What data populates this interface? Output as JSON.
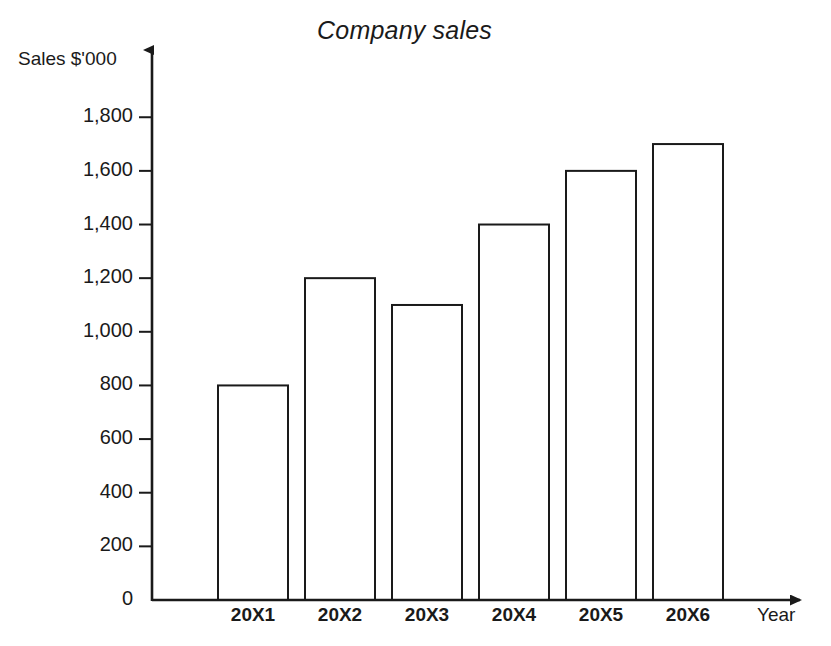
{
  "chart_data": {
    "type": "bar",
    "title": "Company sales",
    "xlabel": "Year",
    "ylabel": "Sales $'000",
    "categories": [
      "20X1",
      "20X2",
      "20X3",
      "20X4",
      "20X5",
      "20X6"
    ],
    "values": [
      800,
      1200,
      1100,
      1400,
      1600,
      1700
    ],
    "ylim": [
      0,
      1900
    ],
    "yticks": [
      0,
      200,
      400,
      600,
      800,
      1000,
      1200,
      1400,
      1600,
      1800
    ],
    "ytick_labels": [
      "0",
      "200",
      "400",
      "600",
      "800",
      "1,000",
      "1,200",
      "1,400",
      "1,600",
      "1,800"
    ],
    "grid": false,
    "legend": null,
    "bar_fill_color": "#ffffff",
    "bar_outline_color": "#1a1a1a",
    "axis_color": "#1a1a1a",
    "background_color": "#ffffff"
  }
}
